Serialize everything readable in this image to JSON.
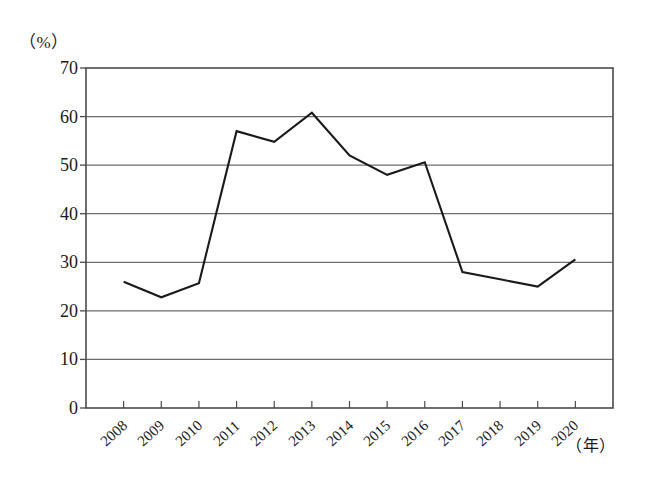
{
  "chart_data": {
    "type": "line",
    "title": "",
    "xlabel": "（年）",
    "ylabel": "（%）",
    "categories": [
      "2008",
      "2009",
      "2010",
      "2011",
      "2012",
      "2013",
      "2014",
      "2015",
      "2016",
      "2017",
      "2018",
      "2019",
      "2020"
    ],
    "values": [
      26.0,
      22.8,
      25.7,
      57.0,
      54.8,
      60.8,
      52.0,
      48.0,
      50.6,
      28.0,
      26.5,
      25.0,
      30.6
    ],
    "series": [
      {
        "name": "",
        "values": [
          26.0,
          22.8,
          25.7,
          57.0,
          54.8,
          60.8,
          52.0,
          48.0,
          50.6,
          28.0,
          26.5,
          25.0,
          30.6
        ]
      }
    ],
    "ylim": [
      0,
      70
    ],
    "ytick_labels": [
      "70",
      "60",
      "50",
      "40",
      "30",
      "20",
      "10",
      "0"
    ],
    "ytick_values": [
      70,
      60,
      50,
      40,
      30,
      20,
      10,
      0
    ],
    "grid": true,
    "grid_orientation": "horizontal",
    "legend": "none",
    "line_color": "#1a1a1a",
    "grid_color": "#6e6e6e",
    "frame_color": "#4a4a4a",
    "background_color": "#ffffff"
  },
  "axes": {
    "y_unit": "（%）",
    "x_unit": "（年）"
  }
}
